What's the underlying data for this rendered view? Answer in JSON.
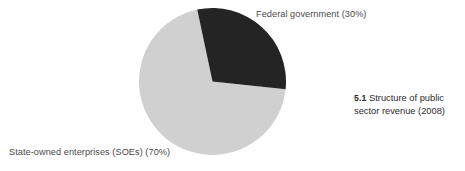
{
  "figure": {
    "caption_number": "5.1",
    "caption_text": "Structure of public sector revenue (2008)"
  },
  "labels": {
    "federal": "Federal government (30%)",
    "soes": "State-owned enterprises (SOEs) (70%)"
  },
  "chart_data": {
    "type": "pie",
    "title": "Structure of public sector revenue (2008)",
    "categories": [
      "Federal government",
      "State-owned enterprises (SOEs)"
    ],
    "values": [
      30,
      70
    ],
    "value_unit": "percent",
    "labels": [
      "Federal government (30%)",
      "State-owned enterprises (SOEs) (70%)"
    ],
    "colors": [
      "#242424",
      "#d0d0d0"
    ],
    "legend": "none",
    "annotations": "direct callout labels placed outside the pie",
    "start_angle_deg": -12,
    "direction": "clockwise",
    "grid": false,
    "xlabel": "",
    "ylabel": ""
  },
  "colors": {
    "background": "#ffffff",
    "slice_federal": "#242424",
    "slice_soes": "#d0d0d0",
    "label_text": "#4a4a4a",
    "caption_text": "#2b2b2b"
  }
}
